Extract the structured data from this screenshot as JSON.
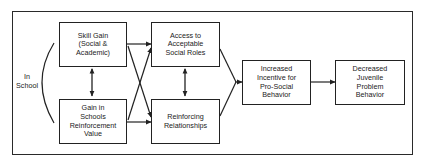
{
  "diagram": {
    "type": "flow",
    "context_label": {
      "lines": [
        "In",
        "School"
      ]
    },
    "nodes": [
      {
        "id": "skill_gain",
        "lines": [
          "Skill Gain",
          "(Social &",
          "Academic)"
        ]
      },
      {
        "id": "school_reinforcement",
        "lines": [
          "Gain in",
          "Schools",
          "Reinforcement",
          "Value"
        ]
      },
      {
        "id": "social_roles",
        "lines": [
          "Access to",
          "Acceptable",
          "Social Roles"
        ]
      },
      {
        "id": "reinforcing_relationships",
        "lines": [
          "Reinforcing",
          "Relationships"
        ]
      },
      {
        "id": "incentive",
        "lines": [
          "Increased",
          "Incentive for",
          "Pro-Social",
          "Behavior"
        ]
      },
      {
        "id": "outcome",
        "lines": [
          "Decreased",
          "Juvenile",
          "Problem",
          "Behavior"
        ]
      }
    ],
    "edges": [
      {
        "from": "skill_gain",
        "to": "school_reinforcement",
        "bidirectional": true
      },
      {
        "from": "skill_gain",
        "to": "social_roles"
      },
      {
        "from": "skill_gain",
        "to": "reinforcing_relationships"
      },
      {
        "from": "school_reinforcement",
        "to": "social_roles"
      },
      {
        "from": "school_reinforcement",
        "to": "reinforcing_relationships"
      },
      {
        "from": "social_roles",
        "to": "reinforcing_relationships",
        "bidirectional": true
      },
      {
        "from": "social_roles",
        "to": "incentive"
      },
      {
        "from": "reinforcing_relationships",
        "to": "incentive"
      },
      {
        "from": "incentive",
        "to": "outcome"
      }
    ]
  }
}
